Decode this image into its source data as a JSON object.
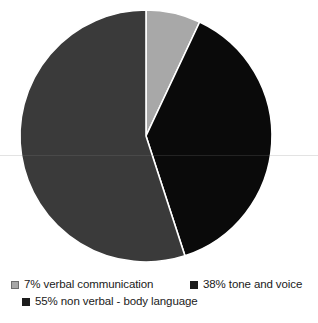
{
  "chart_data": {
    "type": "pie",
    "title": "",
    "subtitle": "",
    "xlabel": "",
    "ylabel": "",
    "grid": false,
    "legend_position": "bottom",
    "start_angle_deg": 0,
    "direction": "clockwise",
    "categories": [
      "7% verbal communication",
      "38% tone and voice",
      "55% non verbal - body language"
    ],
    "values": [
      7,
      38,
      55
    ],
    "units": "percent",
    "slices": [
      {
        "label": "7% verbal communication",
        "short_label": "verbal communication",
        "value": 7,
        "percent": "7%",
        "color": "#a8a8a8",
        "start_deg": 0,
        "sweep_deg": 25.2
      },
      {
        "label": "38% tone and voice",
        "short_label": "tone and voice",
        "value": 38,
        "percent": "38%",
        "color": "#0a0a0a",
        "start_deg": 25.2,
        "sweep_deg": 136.8
      },
      {
        "label": "55% non verbal - body language",
        "short_label": "non verbal - body language",
        "value": 55,
        "percent": "55%",
        "color": "#3a3a3a",
        "start_deg": 162,
        "sweep_deg": 198
      }
    ]
  },
  "pie": {
    "center_x": 146,
    "center_y": 136,
    "radius": 126,
    "separator_color": "#ffffff",
    "background": "#ffffff"
  },
  "legend": {
    "rows": [
      {
        "entries": [
          {
            "label": "7% verbal communication",
            "swatch_color": "#a8a8a8",
            "swatch_style": "light"
          },
          {
            "label": "38% tone and voice",
            "swatch_color": "#1c1c1c",
            "swatch_style": "dark"
          }
        ]
      },
      {
        "entries": [
          {
            "label": "55% non verbal - body language",
            "swatch_color": "#1c1c1c",
            "swatch_style": "dark"
          }
        ]
      }
    ]
  }
}
